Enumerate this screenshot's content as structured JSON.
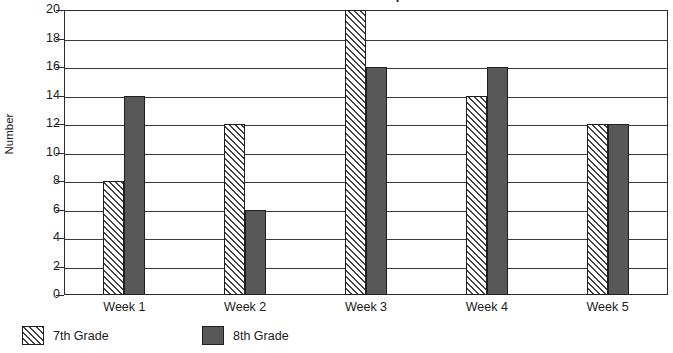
{
  "chart_data": {
    "type": "bar",
    "title": "Students per Week",
    "xlabel": "",
    "ylabel": "Number",
    "categories": [
      "Week 1",
      "Week 2",
      "Week 3",
      "Week 4",
      "Week 5"
    ],
    "series": [
      {
        "name": "7th Grade",
        "values": [
          8,
          12,
          20,
          14,
          12
        ],
        "fill": "hatch-diagonal",
        "color": "#ffffff"
      },
      {
        "name": "8th Grade",
        "values": [
          14,
          6,
          16,
          16,
          12
        ],
        "fill": "solid",
        "color": "#585858"
      }
    ],
    "ylim": [
      0,
      20
    ],
    "yticks": [
      0,
      2,
      4,
      6,
      8,
      10,
      12,
      14,
      16,
      18,
      20
    ],
    "ytick_labels": [
      "0",
      "2",
      "4",
      "6",
      "8",
      "10",
      "12",
      "14",
      "16",
      "18",
      "20"
    ],
    "grid": true,
    "grid_axis": "y",
    "legend_position": "bottom-left",
    "axis_color": "#2b2b2b",
    "background": "#ffffff"
  }
}
